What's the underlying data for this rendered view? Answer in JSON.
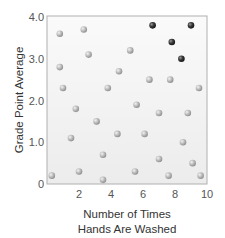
{
  "chart_data": {
    "type": "scatter",
    "title": "",
    "xlabel": "Number of Times Hands Are Washed",
    "xlabel_lines": [
      "Number of Times",
      "Hands Are Washed"
    ],
    "ylabel": "Grade Point Average",
    "xlim": [
      0,
      10
    ],
    "ylim": [
      0,
      4.0
    ],
    "xticks": [
      {
        "value": 2,
        "label": "2"
      },
      {
        "value": 4,
        "label": "4"
      },
      {
        "value": 6,
        "label": "6"
      },
      {
        "value": 8,
        "label": "8"
      },
      {
        "value": 10,
        "label": "10"
      }
    ],
    "yticks": [
      {
        "value": 0,
        "label": "0"
      },
      {
        "value": 1,
        "label": "1.0"
      },
      {
        "value": 2,
        "label": "2.0"
      },
      {
        "value": 3,
        "label": "3.0"
      },
      {
        "value": 4,
        "label": "4.0"
      }
    ],
    "grid": false,
    "legend": null,
    "series": [
      {
        "name": "light points",
        "color": "#b5b5b5",
        "points": [
          [
            0.3,
            0.2
          ],
          [
            0.8,
            3.6
          ],
          [
            2.3,
            3.7
          ],
          [
            2.6,
            3.1
          ],
          [
            0.8,
            2.8
          ],
          [
            1.0,
            2.3
          ],
          [
            4.5,
            2.7
          ],
          [
            3.8,
            2.3
          ],
          [
            5.2,
            3.2
          ],
          [
            6.4,
            2.5
          ],
          [
            7.7,
            2.5
          ],
          [
            9.5,
            2.3
          ],
          [
            1.8,
            1.8
          ],
          [
            5.6,
            1.9
          ],
          [
            7.0,
            1.7
          ],
          [
            8.8,
            1.7
          ],
          [
            3.1,
            1.5
          ],
          [
            1.5,
            1.1
          ],
          [
            4.4,
            1.2
          ],
          [
            6.1,
            1.2
          ],
          [
            8.5,
            1.0
          ],
          [
            3.5,
            0.7
          ],
          [
            7.0,
            0.6
          ],
          [
            9.1,
            0.5
          ],
          [
            2.0,
            0.3
          ],
          [
            5.5,
            0.3
          ],
          [
            7.6,
            0.2
          ],
          [
            9.6,
            0.2
          ],
          [
            3.5,
            0.1
          ]
        ]
      },
      {
        "name": "dark points",
        "color": "#3a3a3a",
        "points": [
          [
            6.6,
            3.8
          ],
          [
            9.0,
            3.8
          ],
          [
            7.8,
            3.4
          ],
          [
            8.4,
            3.0
          ]
        ]
      }
    ]
  },
  "colors": {
    "plot_background_top": "#f9f9f9",
    "plot_background_bottom": "#ededed",
    "frame": "#b0b0b0",
    "light_point": "#b5b5b5",
    "dark_point": "#3a3a3a"
  }
}
